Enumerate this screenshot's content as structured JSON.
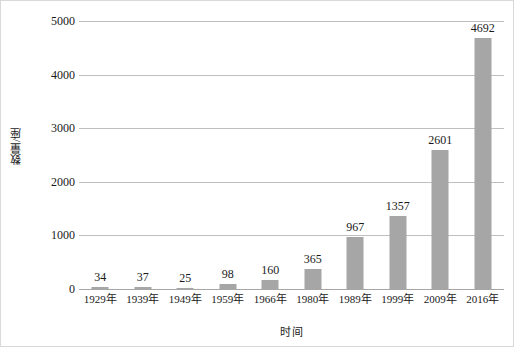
{
  "chart_data": {
    "type": "bar",
    "title": "",
    "subtitle": "",
    "xlabel": "时间",
    "ylabel": "数量/座",
    "categories": [
      "1929年",
      "1939年",
      "1949年",
      "1959年",
      "1966年",
      "1980年",
      "1989年",
      "1999年",
      "2009年",
      "2016年"
    ],
    "values": [
      34,
      37,
      25,
      98,
      160,
      365,
      967,
      1357,
      2601,
      4692
    ],
    "data_labels": [
      "34",
      "37",
      "25",
      "98",
      "160",
      "365",
      "967",
      "1357",
      "2601",
      "4692"
    ],
    "ylim": [
      0,
      5000
    ],
    "ytick_values": [
      0,
      1000,
      2000,
      3000,
      4000,
      5000
    ],
    "ytick_labels": [
      "0",
      "1000",
      "2000",
      "3000",
      "4000",
      "5000"
    ],
    "grid": "horizontal",
    "legend": "none",
    "bar_color": "#a6a6a6",
    "gridline_color": "#bfbfbf",
    "axis_color": "#a6a6a6",
    "background_color": "#ffffff",
    "border_color": "#d9d9d9"
  }
}
